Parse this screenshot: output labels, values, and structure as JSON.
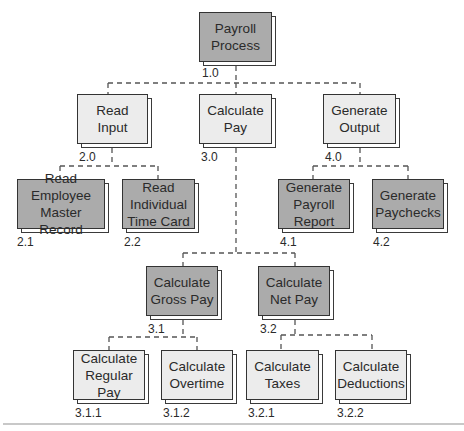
{
  "colors": {
    "light_box": "#ececec",
    "dark_box": "#ababab",
    "border": "#333333",
    "connector": "#555555"
  },
  "nodes": [
    {
      "id": "1.0",
      "label": "Payroll\nProcess",
      "shade": "dark"
    },
    {
      "id": "2.0",
      "label": "Read\nInput",
      "shade": "light"
    },
    {
      "id": "3.0",
      "label": "Calculate\nPay",
      "shade": "light"
    },
    {
      "id": "4.0",
      "label": "Generate\nOutput",
      "shade": "light"
    },
    {
      "id": "2.1",
      "label": "Read\nEmployee\nMaster Record",
      "shade": "dark"
    },
    {
      "id": "2.2",
      "label": "Read\nIndividual\nTime Card",
      "shade": "dark"
    },
    {
      "id": "4.1",
      "label": "Generate\nPayroll\nReport",
      "shade": "dark"
    },
    {
      "id": "4.2",
      "label": "Generate\nPaychecks",
      "shade": "dark"
    },
    {
      "id": "3.1",
      "label": "Calculate\nGross Pay",
      "shade": "dark"
    },
    {
      "id": "3.2",
      "label": "Calculate\nNet Pay",
      "shade": "dark"
    },
    {
      "id": "3.1.1",
      "label": "Calculate\nRegular\nPay",
      "shade": "light"
    },
    {
      "id": "3.1.2",
      "label": "Calculate\nOvertime",
      "shade": "light"
    },
    {
      "id": "3.2.1",
      "label": "Calculate\nTaxes",
      "shade": "light"
    },
    {
      "id": "3.2.2",
      "label": "Calculate\nDeductions",
      "shade": "light"
    }
  ],
  "edges": [
    [
      "1.0",
      "2.0"
    ],
    [
      "1.0",
      "3.0"
    ],
    [
      "1.0",
      "4.0"
    ],
    [
      "2.0",
      "2.1"
    ],
    [
      "2.0",
      "2.2"
    ],
    [
      "4.0",
      "4.1"
    ],
    [
      "4.0",
      "4.2"
    ],
    [
      "3.0",
      "3.1"
    ],
    [
      "3.0",
      "3.2"
    ],
    [
      "3.1",
      "3.1.1"
    ],
    [
      "3.1",
      "3.1.2"
    ],
    [
      "3.2",
      "3.2.1"
    ],
    [
      "3.2",
      "3.2.2"
    ]
  ]
}
